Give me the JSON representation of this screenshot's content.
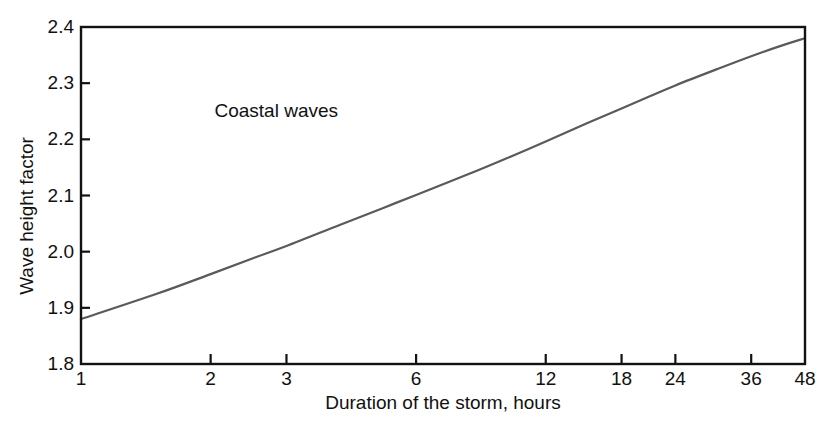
{
  "chart_data": {
    "type": "line",
    "title": "",
    "subtitle": "",
    "xlabel": "Duration of the storm, hours",
    "ylabel": "Wave height factor",
    "xscale": "log",
    "yscale": "linear",
    "xlim": [
      1,
      48
    ],
    "ylim": [
      1.8,
      2.4
    ],
    "grid": false,
    "legend": null,
    "xticks": [
      1,
      2,
      3,
      6,
      12,
      18,
      24,
      36,
      48
    ],
    "xticklabels": [
      "1",
      "2",
      "3",
      "6",
      "12",
      "18",
      "24",
      "36",
      "48"
    ],
    "yticks": [
      1.8,
      1.9,
      2.0,
      2.1,
      2.2,
      2.3,
      2.4
    ],
    "yticklabels": [
      "1.8",
      "1.9",
      "2.0",
      "2.1",
      "2.2",
      "2.3",
      "2.4"
    ],
    "annotations": [
      {
        "text": "Coastal waves",
        "x": 3.0,
        "y": 2.25
      }
    ],
    "series": [
      {
        "name": "Coastal waves",
        "color": "#5a5a5a",
        "linewidth": 2.2,
        "x": [
          1,
          1.5,
          2,
          2.5,
          3,
          4,
          5,
          6,
          8,
          10,
          12,
          15,
          18,
          21,
          24,
          30,
          36,
          42,
          48
        ],
        "y": [
          1.88,
          1.925,
          1.96,
          1.988,
          2.01,
          2.048,
          2.077,
          2.101,
          2.139,
          2.17,
          2.196,
          2.229,
          2.255,
          2.277,
          2.296,
          2.325,
          2.348,
          2.366,
          2.38
        ]
      }
    ]
  },
  "axis": {
    "y_title": "Wave height factor",
    "x_title": "Duration of the storm, hours"
  },
  "annotation": {
    "series_label": "Coastal waves"
  },
  "colors": {
    "curve": "#5a5a5a",
    "frame": "#121212",
    "text": "#111111",
    "background": "#ffffff"
  }
}
